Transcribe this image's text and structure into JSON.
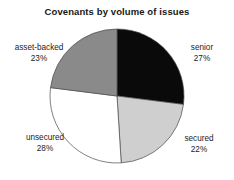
{
  "chart_data": {
    "type": "pie",
    "title": "Covenants by volume of issues",
    "categories": [
      "senior",
      "secured",
      "unsecured",
      "asset-backed"
    ],
    "values": [
      27,
      22,
      28,
      23
    ],
    "unit": "%",
    "labels": [
      "27%",
      "22%",
      "28%",
      "23%"
    ],
    "colors": [
      "#0a0a0a",
      "#cfcfcf",
      "#ffffff",
      "#8a8a8a"
    ],
    "start_angle_deg": 0,
    "direction": "clockwise",
    "legend": "none",
    "grid": false,
    "slice_outline": "#4a4a4a",
    "background": "#ffffff"
  },
  "chart": {
    "title": "Covenants by volume of issues",
    "slices": [
      {
        "name": "senior",
        "value": "27%",
        "color": "#0a0a0a"
      },
      {
        "name": "secured",
        "value": "22%",
        "color": "#cfcfcf"
      },
      {
        "name": "unsecured",
        "value": "28%",
        "color": "#ffffff"
      },
      {
        "name": "asset-backed",
        "value": "23%",
        "color": "#8a8a8a"
      }
    ]
  }
}
